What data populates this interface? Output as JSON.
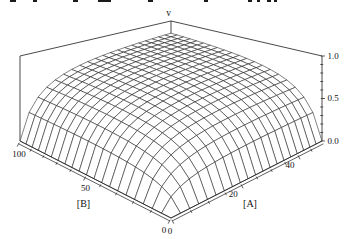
{
  "window": {
    "width": 351,
    "height": 239,
    "background": "#ffffff"
  },
  "clipped_top_text_fragments": [
    {
      "x": 10,
      "w": 6
    },
    {
      "x": 33,
      "w": 4
    },
    {
      "x": 73,
      "w": 5
    },
    {
      "x": 98,
      "w": 13
    },
    {
      "x": 148,
      "w": 5
    },
    {
      "x": 204,
      "w": 4
    },
    {
      "x": 248,
      "w": 4
    },
    {
      "x": 257,
      "w": 3
    },
    {
      "x": 267,
      "w": 4
    },
    {
      "x": 274,
      "w": 3
    }
  ],
  "chart_data": {
    "type": "surface3d",
    "title": "",
    "z_axis": {
      "label": "v",
      "range": [
        0,
        1
      ],
      "major_ticks": [
        {
          "value": 0.0,
          "label": "0.0"
        },
        {
          "value": 0.5,
          "label": "0.5"
        },
        {
          "value": 1.0,
          "label": "1.0"
        }
      ],
      "minor_tick_step": 0.1
    },
    "x_axis": {
      "label": "[A]",
      "range": [
        0,
        50
      ],
      "major_ticks": [
        {
          "value": 0,
          "label": "0"
        },
        {
          "value": 20,
          "label": "20"
        },
        {
          "value": 40,
          "label": "40"
        }
      ],
      "minor_tick_step": 5
    },
    "y_axis": {
      "label": "[B]",
      "range": [
        0,
        100
      ],
      "major_ticks": [
        {
          "value": 0,
          "label": "0"
        },
        {
          "value": 50,
          "label": "50"
        },
        {
          "value": 100,
          "label": "100"
        }
      ],
      "minor_tick_step": 10
    },
    "surface": {
      "formula": "v = (A/(A+K_A)) * (B/(B+K_B))",
      "K_A": 5,
      "K_B": 10,
      "mesh_divisions": 20,
      "value_at_max_corner": 0.83
    },
    "line_color": "#1c1c1c",
    "fill_color": "#ffffff"
  }
}
